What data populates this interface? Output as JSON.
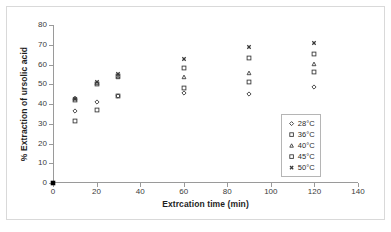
{
  "figure": {
    "background_color": "#ffffff",
    "frame_color": "#d9d9d9",
    "axis_color": "#9a9a9a",
    "marker_color": "#3a3a3a",
    "origin_marker_color": "#000000"
  },
  "chart_data": {
    "type": "scatter",
    "title": "",
    "xlabel": "Extrcation time (min)",
    "ylabel": "% Extraction of ursolic acid",
    "xlim": [
      0,
      140
    ],
    "ylim": [
      0,
      80
    ],
    "xticks": [
      0,
      20,
      40,
      60,
      80,
      100,
      120,
      140
    ],
    "yticks": [
      0,
      10,
      20,
      30,
      40,
      50,
      60,
      70,
      80
    ],
    "grid": false,
    "legend_position": "lower-right-inside",
    "x": [
      0,
      10,
      20,
      30,
      60,
      90,
      120
    ],
    "series": [
      {
        "name": "28°C",
        "marker": "diamond-open",
        "values": [
          0,
          36.5,
          41.0,
          44.0,
          45.5,
          45.0,
          48.5
        ]
      },
      {
        "name": "36°C",
        "marker": "square-open",
        "values": [
          0,
          31.5,
          37.0,
          44.3,
          48.0,
          51.0,
          56.0
        ]
      },
      {
        "name": "40°C",
        "marker": "triangle-open",
        "values": [
          0,
          43.0,
          50.5,
          53.5,
          53.5,
          55.5,
          60.5
        ]
      },
      {
        "name": "45°C",
        "marker": "square-open",
        "values": [
          0,
          42.0,
          50.0,
          54.0,
          58.0,
          63.5,
          65.5
        ]
      },
      {
        "name": "50°C",
        "marker": "cross-x",
        "values": [
          0,
          42.5,
          51.0,
          55.0,
          63.0,
          69.0,
          71.0
        ]
      }
    ],
    "origin_point": {
      "label": "origin-marker",
      "marker": "square-filled",
      "x": 0,
      "y": 0
    },
    "legend": [
      {
        "label": "28°C",
        "marker": "diamond-open"
      },
      {
        "label": "36°C",
        "marker": "square-open"
      },
      {
        "label": "40°C",
        "marker": "triangle-open"
      },
      {
        "label": "45°C",
        "marker": "square-open"
      },
      {
        "label": "50°C",
        "marker": "cross-x"
      }
    ]
  }
}
